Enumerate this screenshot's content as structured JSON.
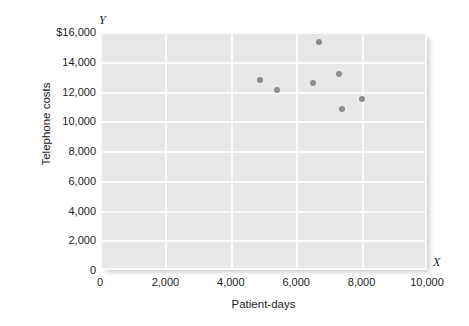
{
  "chart_data": {
    "type": "scatter",
    "title": "",
    "xlabel": "Patient-days",
    "ylabel": "Telephone costs",
    "x_axis_letter": "X",
    "y_axis_letter": "Y",
    "xlim": [
      0,
      10000
    ],
    "ylim": [
      0,
      16000
    ],
    "xticks": [
      0,
      2000,
      4000,
      6000,
      8000,
      10000
    ],
    "yticks": [
      0,
      2000,
      4000,
      6000,
      8000,
      10000,
      12000,
      14000,
      16000
    ],
    "xtick_labels": [
      "0",
      "2,000",
      "4,000",
      "6,000",
      "8,000",
      "10,000"
    ],
    "ytick_labels": [
      "0",
      "2,000",
      "4,000",
      "6,000",
      "8,000",
      "10,000",
      "12,000",
      "14,000",
      "$16,000"
    ],
    "grid": true,
    "legend": false,
    "plot_background_color": "#e8e8e8",
    "gridline_color": "#fbfbfb",
    "marker_color": "#8d8d8d",
    "points": [
      {
        "x": 4900,
        "y": 12800
      },
      {
        "x": 5400,
        "y": 12100
      },
      {
        "x": 6500,
        "y": 12600
      },
      {
        "x": 6700,
        "y": 15300
      },
      {
        "x": 7300,
        "y": 13200
      },
      {
        "x": 7400,
        "y": 10800
      },
      {
        "x": 8000,
        "y": 11500
      }
    ]
  }
}
